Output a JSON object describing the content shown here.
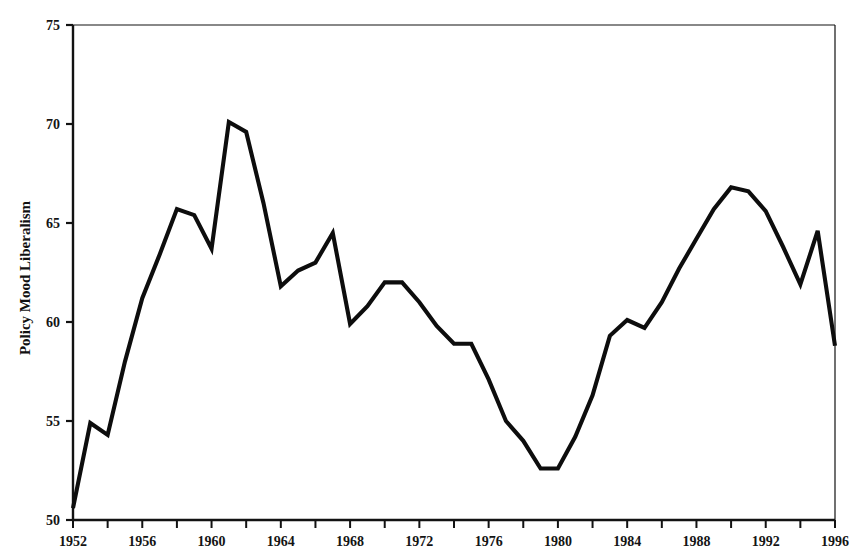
{
  "chart_data": {
    "type": "line",
    "title": "",
    "xlabel": "",
    "ylabel": "Policy Mood Liberalism",
    "xlim": [
      1952,
      1996
    ],
    "ylim": [
      50,
      75
    ],
    "grid": false,
    "legend": null,
    "y_ticks": [
      50,
      55,
      60,
      65,
      70,
      75
    ],
    "y_tick_labels": [
      "50",
      "55",
      "60",
      "65",
      "70",
      "75"
    ],
    "x_ticks": [
      1952,
      1954,
      1956,
      1958,
      1960,
      1962,
      1964,
      1966,
      1968,
      1970,
      1972,
      1974,
      1976,
      1978,
      1980,
      1982,
      1984,
      1986,
      1988,
      1990,
      1992,
      1994,
      1996
    ],
    "x_tick_labels_shown": [
      "1952",
      "1956",
      "1960",
      "1964",
      "1968",
      "1972",
      "1976",
      "1980",
      "1984",
      "1988",
      "1992",
      "1996"
    ],
    "x_tick_labels_shown_values": [
      1952,
      1956,
      1960,
      1964,
      1968,
      1972,
      1976,
      1980,
      1984,
      1988,
      1992,
      1996
    ],
    "line_color": "#0d0d0d",
    "series": [
      {
        "name": "Policy Mood Liberalism",
        "x": [
          1952,
          1953,
          1954,
          1955,
          1956,
          1957,
          1958,
          1959,
          1960,
          1961,
          1962,
          1963,
          1964,
          1965,
          1966,
          1967,
          1968,
          1969,
          1970,
          1971,
          1972,
          1973,
          1974,
          1975,
          1976,
          1977,
          1978,
          1979,
          1980,
          1981,
          1982,
          1983,
          1984,
          1985,
          1986,
          1987,
          1988,
          1989,
          1990,
          1991,
          1992,
          1993,
          1994,
          1995,
          1996
        ],
        "values": [
          50.6,
          54.9,
          54.3,
          58.0,
          61.2,
          63.4,
          65.7,
          65.4,
          63.7,
          70.1,
          69.6,
          66.0,
          61.8,
          62.6,
          63.0,
          64.5,
          59.9,
          60.8,
          62.0,
          62.0,
          61.0,
          59.8,
          58.9,
          58.9,
          57.1,
          55.0,
          54.0,
          52.6,
          52.6,
          54.2,
          56.3,
          59.3,
          60.1,
          59.7,
          61.0,
          62.7,
          64.2,
          65.7,
          66.8,
          66.6,
          65.6,
          63.8,
          61.9,
          64.6,
          58.8
        ]
      }
    ]
  },
  "axis": {
    "y_title": "Policy Mood Liberalism"
  }
}
